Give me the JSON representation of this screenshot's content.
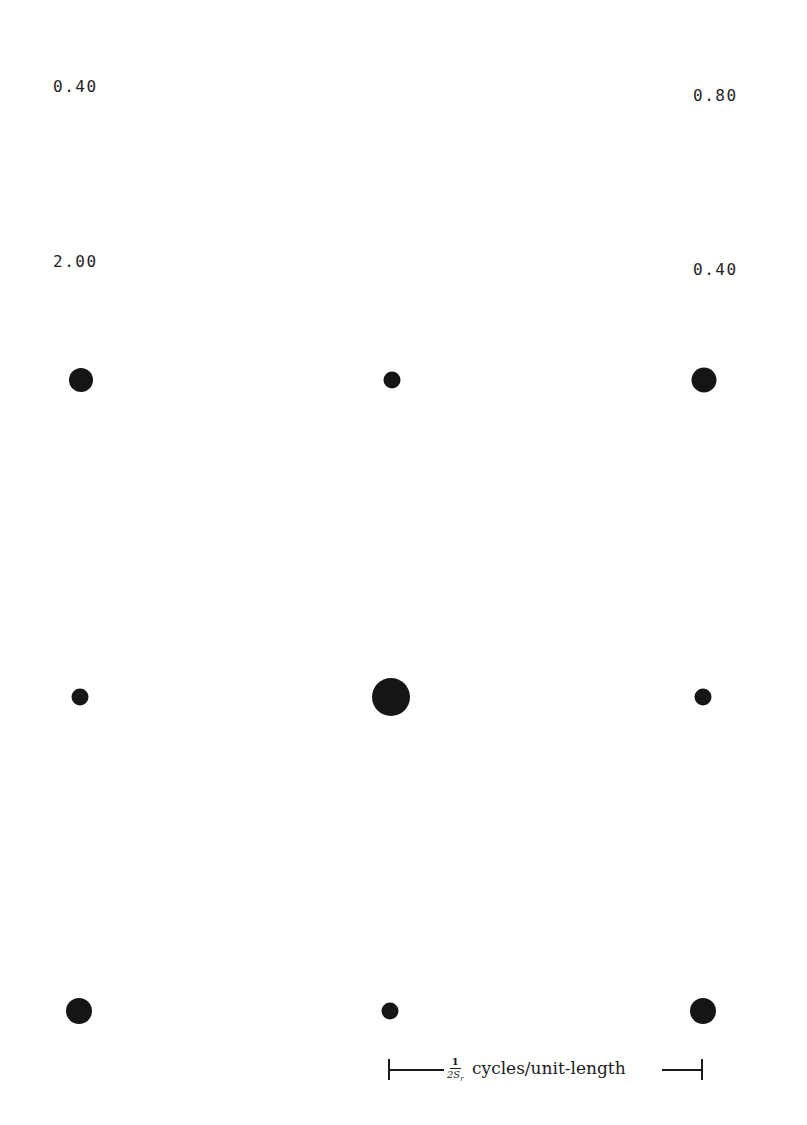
{
  "labels": {
    "top_left": "0.40",
    "top_right": "0.80",
    "second_left": "2.00",
    "second_right": "0.40"
  },
  "grid": {
    "description": "3x3 lattice of dots; dot area encodes magnitude",
    "rows": [
      {
        "y": 380,
        "dots": [
          {
            "x": 81,
            "diameter": 24
          },
          {
            "x": 392,
            "diameter": 17
          },
          {
            "x": 704,
            "diameter": 25
          }
        ]
      },
      {
        "y": 697,
        "dots": [
          {
            "x": 80,
            "diameter": 17
          },
          {
            "x": 391,
            "diameter": 38
          },
          {
            "x": 703,
            "diameter": 17
          }
        ]
      },
      {
        "y": 1011,
        "dots": [
          {
            "x": 79,
            "diameter": 26
          },
          {
            "x": 390,
            "diameter": 17
          },
          {
            "x": 703,
            "diameter": 26
          }
        ]
      }
    ],
    "dot_color": "#151515"
  },
  "scale_bar": {
    "fraction_numerator": "1",
    "fraction_denominator": "2S",
    "fraction_subscript": "r",
    "unit_text": "cycles/unit-length"
  }
}
